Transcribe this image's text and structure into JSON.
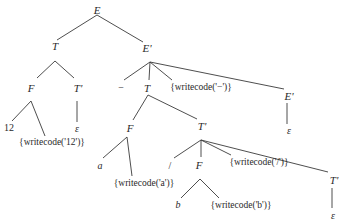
{
  "diagram": {
    "type": "annotated-parse-tree",
    "nodes": [
      {
        "id": "n1",
        "label": "E",
        "kind": "nonterminal",
        "x": 97,
        "y": 10
      },
      {
        "id": "n2",
        "label": "T",
        "kind": "nonterminal",
        "x": 55,
        "y": 46
      },
      {
        "id": "n3",
        "label": "E'",
        "kind": "nonterminal",
        "x": 147,
        "y": 48
      },
      {
        "id": "n4",
        "label": "F",
        "kind": "nonterminal",
        "x": 31,
        "y": 88
      },
      {
        "id": "n5",
        "label": "T'",
        "kind": "nonterminal",
        "x": 78,
        "y": 88
      },
      {
        "id": "n6",
        "label": "12",
        "kind": "terminal",
        "x": 9,
        "y": 128
      },
      {
        "id": "n7",
        "label": "{writecode('12')}",
        "kind": "action",
        "x": 52,
        "y": 143
      },
      {
        "id": "n8",
        "label": "ε",
        "kind": "epsilon",
        "x": 77,
        "y": 129
      },
      {
        "id": "n9",
        "label": "−",
        "kind": "terminal",
        "x": 121,
        "y": 88
      },
      {
        "id": "n10",
        "label": "T",
        "kind": "nonterminal",
        "x": 147,
        "y": 88
      },
      {
        "id": "n11",
        "label": "{writecode('−')}",
        "kind": "action",
        "x": 201,
        "y": 88
      },
      {
        "id": "n12",
        "label": "E'",
        "kind": "nonterminal",
        "x": 289,
        "y": 96
      },
      {
        "id": "n13",
        "label": "ε",
        "kind": "epsilon",
        "x": 289,
        "y": 131
      },
      {
        "id": "n14",
        "label": "F",
        "kind": "nonterminal",
        "x": 130,
        "y": 128
      },
      {
        "id": "n15",
        "label": "T'",
        "kind": "nonterminal",
        "x": 202,
        "y": 126
      },
      {
        "id": "n16",
        "label": "a",
        "kind": "terminal-id",
        "x": 100,
        "y": 166
      },
      {
        "id": "n17",
        "label": "{writecode('a')}",
        "kind": "action",
        "x": 144,
        "y": 184
      },
      {
        "id": "n18",
        "label": "/",
        "kind": "terminal",
        "x": 170,
        "y": 166
      },
      {
        "id": "n19",
        "label": "F",
        "kind": "nonterminal",
        "x": 199,
        "y": 165
      },
      {
        "id": "n20",
        "label": "{writecode('/')}",
        "kind": "action",
        "x": 259,
        "y": 163
      },
      {
        "id": "n21",
        "label": "T'",
        "kind": "nonterminal",
        "x": 334,
        "y": 180
      },
      {
        "id": "n22",
        "label": "b",
        "kind": "terminal-id",
        "x": 178,
        "y": 205
      },
      {
        "id": "n23",
        "label": "{writecode('b')}",
        "kind": "action",
        "x": 241,
        "y": 206
      },
      {
        "id": "n24",
        "label": "ε",
        "kind": "epsilon",
        "x": 333,
        "y": 216
      }
    ],
    "edges": [
      {
        "from": "n1",
        "to": "n2",
        "x1": 97,
        "y1": 15,
        "x2": 57,
        "y2": 40
      },
      {
        "from": "n1",
        "to": "n3",
        "x1": 97,
        "y1": 15,
        "x2": 143,
        "y2": 42
      },
      {
        "from": "n2",
        "to": "n4",
        "x1": 55,
        "y1": 61,
        "x2": 37,
        "y2": 78
      },
      {
        "from": "n2",
        "to": "n5",
        "x1": 55,
        "y1": 61,
        "x2": 74,
        "y2": 78
      },
      {
        "from": "n4",
        "to": "n6",
        "x1": 31,
        "y1": 101,
        "x2": 12,
        "y2": 121
      },
      {
        "from": "n4",
        "to": "n7",
        "x1": 31,
        "y1": 101,
        "x2": 45,
        "y2": 136
      },
      {
        "from": "n5",
        "to": "n8",
        "x1": 77,
        "y1": 101,
        "x2": 77,
        "y2": 122
      },
      {
        "from": "n3",
        "to": "n9",
        "x1": 150,
        "y1": 62,
        "x2": 124,
        "y2": 80
      },
      {
        "from": "n3",
        "to": "n10",
        "x1": 150,
        "y1": 62,
        "x2": 149,
        "y2": 80
      },
      {
        "from": "n3",
        "to": "n11",
        "x1": 150,
        "y1": 62,
        "x2": 172,
        "y2": 80
      },
      {
        "from": "n3",
        "to": "n12",
        "x1": 150,
        "y1": 62,
        "x2": 284,
        "y2": 89
      },
      {
        "from": "n12",
        "to": "n13",
        "x1": 287,
        "y1": 103,
        "x2": 287,
        "y2": 124
      },
      {
        "from": "n10",
        "to": "n14",
        "x1": 148,
        "y1": 95,
        "x2": 133,
        "y2": 120
      },
      {
        "from": "n10",
        "to": "n15",
        "x1": 148,
        "y1": 95,
        "x2": 197,
        "y2": 119
      },
      {
        "from": "n14",
        "to": "n16",
        "x1": 127,
        "y1": 137,
        "x2": 103,
        "y2": 158
      },
      {
        "from": "n14",
        "to": "n17",
        "x1": 127,
        "y1": 137,
        "x2": 132,
        "y2": 176
      },
      {
        "from": "n15",
        "to": "n18",
        "x1": 201,
        "y1": 140,
        "x2": 174,
        "y2": 158
      },
      {
        "from": "n15",
        "to": "n19",
        "x1": 201,
        "y1": 140,
        "x2": 201,
        "y2": 157
      },
      {
        "from": "n15",
        "to": "n20",
        "x1": 201,
        "y1": 140,
        "x2": 231,
        "y2": 155
      },
      {
        "from": "n15",
        "to": "n21",
        "x1": 201,
        "y1": 140,
        "x2": 328,
        "y2": 172
      },
      {
        "from": "n19",
        "to": "n22",
        "x1": 200,
        "y1": 179,
        "x2": 181,
        "y2": 198
      },
      {
        "from": "n19",
        "to": "n23",
        "x1": 200,
        "y1": 179,
        "x2": 219,
        "y2": 198
      },
      {
        "from": "n21",
        "to": "n24",
        "x1": 332,
        "y1": 188,
        "x2": 332,
        "y2": 208
      }
    ],
    "colors": {
      "background": "#ffffff",
      "line": "#3a3a3a",
      "text": "#2a2a2a"
    }
  }
}
